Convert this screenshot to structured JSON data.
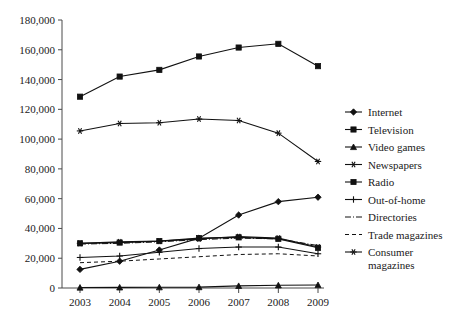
{
  "chart_data": {
    "type": "line",
    "title": "",
    "xlabel": "",
    "ylabel": "",
    "x": [
      "2003",
      "2004",
      "2005",
      "2006",
      "2007",
      "2008",
      "2009"
    ],
    "xtick_labels": [
      "2003",
      "2004",
      "2005",
      "2006",
      "2007",
      "2008",
      "2009"
    ],
    "ytick_labels": [
      "0",
      "20,000",
      "40,000",
      "60,000",
      "80,000",
      "100,000",
      "120,000",
      "140,000",
      "160,000",
      "180,000"
    ],
    "ytick_values": [
      0,
      20000,
      40000,
      60000,
      80000,
      100000,
      120000,
      140000,
      160000,
      180000
    ],
    "ylim": [
      0,
      180000
    ],
    "grid": false,
    "legend_position": "right",
    "series": [
      {
        "name": "Internet",
        "marker": "diamond",
        "linestyle": "solid",
        "values": [
          12500,
          18000,
          25500,
          33500,
          49000,
          58000,
          61000
        ]
      },
      {
        "name": "Television",
        "marker": "square",
        "linestyle": "solid",
        "values": [
          128500,
          142000,
          146500,
          155500,
          161500,
          164000,
          149000
        ]
      },
      {
        "name": "Video games",
        "marker": "triangle",
        "linestyle": "solid",
        "values": [
          300,
          400,
          500,
          600,
          1400,
          1800,
          2000
        ]
      },
      {
        "name": "Newspapers",
        "marker": "asterisk",
        "linestyle": "solid",
        "values": [
          30000,
          31000,
          31500,
          33000,
          34500,
          33500,
          27500
        ]
      },
      {
        "name": "Radio",
        "marker": "square",
        "linestyle": "solid",
        "values": [
          30000,
          30500,
          31500,
          33500,
          34000,
          33000,
          27000
        ]
      },
      {
        "name": "Out-of-home",
        "marker": "plus",
        "linestyle": "solid",
        "values": [
          20500,
          21500,
          24000,
          26500,
          27500,
          27500,
          23000
        ]
      },
      {
        "name": "Directories",
        "marker": "none",
        "linestyle": "dashdot",
        "values": [
          29500,
          30000,
          31000,
          32500,
          33500,
          33000,
          28500
        ]
      },
      {
        "name": "Trade magazines",
        "marker": "none",
        "linestyle": "dashed",
        "values": [
          17000,
          18000,
          19500,
          21000,
          22500,
          23000,
          21500
        ]
      },
      {
        "name": "Consumer magazines",
        "marker": "asterisk",
        "linestyle": "solid",
        "values": [
          105500,
          110500,
          111000,
          113500,
          112500,
          104000,
          85000
        ]
      }
    ],
    "legend_entries": [
      {
        "label": "Internet",
        "marker": "diamond",
        "linestyle": "solid"
      },
      {
        "label": "Television",
        "marker": "square",
        "linestyle": "solid"
      },
      {
        "label": "Video games",
        "marker": "triangle",
        "linestyle": "solid"
      },
      {
        "label": "Newspapers",
        "marker": "asterisk",
        "linestyle": "solid"
      },
      {
        "label": "Radio",
        "marker": "square",
        "linestyle": "solid"
      },
      {
        "label": "Out-of-home",
        "marker": "plus",
        "linestyle": "solid"
      },
      {
        "label": "Directories",
        "marker": "none",
        "linestyle": "dashdot"
      },
      {
        "label": "Trade magazines",
        "marker": "none",
        "linestyle": "dashed"
      },
      {
        "label": "Consumer magazines",
        "marker": "asterisk",
        "linestyle": "solid"
      }
    ],
    "legend_wrapped_labels": [
      [
        "Internet"
      ],
      [
        "Television"
      ],
      [
        "Video games"
      ],
      [
        "Newspapers"
      ],
      [
        "Radio"
      ],
      [
        "Out-of-home"
      ],
      [
        "Directories"
      ],
      [
        "Trade magazines"
      ],
      [
        "Consumer",
        "magazines"
      ]
    ],
    "colors": {
      "line": "#111111",
      "axis": "#4a4a4a",
      "text": "#1a1a1a",
      "background": "#ffffff"
    }
  }
}
